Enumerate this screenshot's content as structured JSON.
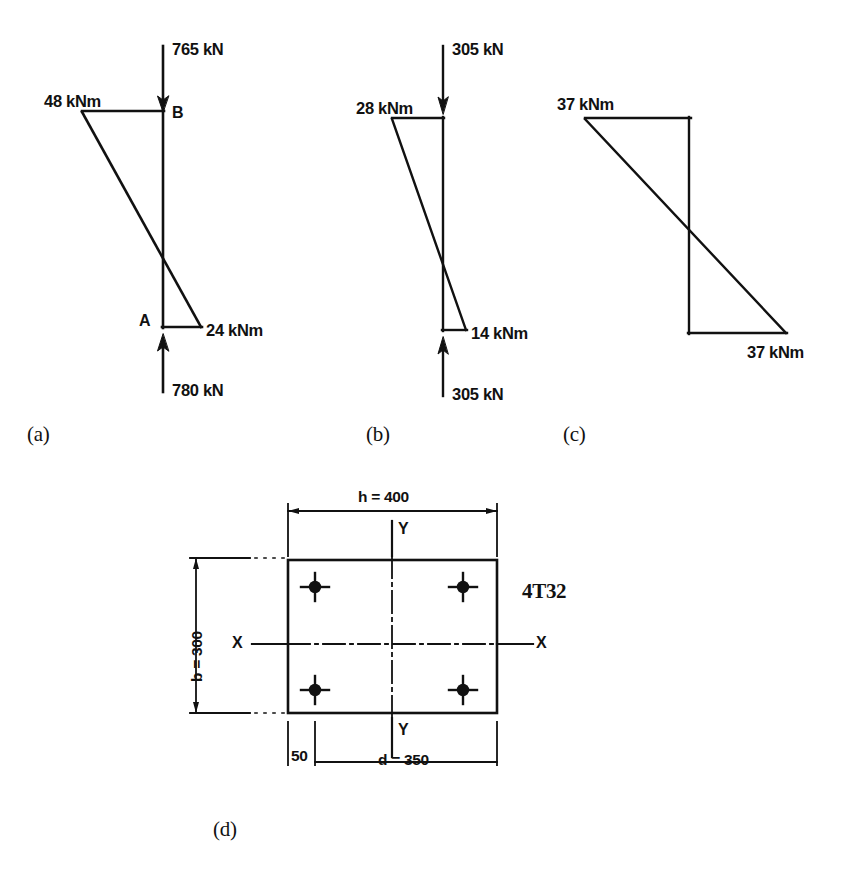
{
  "figure": {
    "background_color": "#ffffff",
    "ink_color": "#111111",
    "parts": [
      {
        "key": "a",
        "part_label": "(a)",
        "top_force": "765 kN",
        "top_force_direction": "down",
        "bottom_force": "780 kN",
        "bottom_force_direction": "up",
        "top_moment": "48 kNm",
        "bottom_moment": "24 kNm",
        "node_top": "B",
        "node_bottom": "A"
      },
      {
        "key": "b",
        "part_label": "(b)",
        "top_force": "305 kN",
        "top_force_direction": "down",
        "bottom_force": "305 kN",
        "bottom_force_direction": "up",
        "top_moment": "28 kNm",
        "bottom_moment": "14 kNm",
        "node_top": "",
        "node_bottom": ""
      },
      {
        "key": "c",
        "part_label": "(c)",
        "top_force": "",
        "bottom_force": "",
        "top_moment": "37 kNm",
        "bottom_moment": "37 kNm",
        "node_top": "",
        "node_bottom": ""
      }
    ],
    "section": {
      "part_label": "(d)",
      "width_dim": "h = 400",
      "height_dim": "b = 300",
      "depth_dim": "d = 350",
      "cover_dim": "50",
      "axis_x_left": "X",
      "axis_x_right": "X",
      "axis_y_top": "Y",
      "axis_y_bottom": "Y",
      "reinforcement": "4T32",
      "bar_count": 4
    },
    "caption": ""
  }
}
